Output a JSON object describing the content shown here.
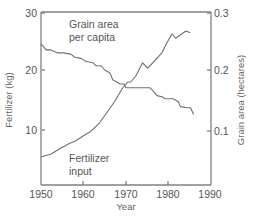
{
  "chart_data": {
    "type": "line",
    "title": "",
    "xlabel": "Year",
    "ylabel": "Fertilizer (kg)",
    "y2label": "Grain area (hectares)",
    "xlim": [
      1950,
      1990
    ],
    "ylim": [
      1,
      30
    ],
    "y2lim": [
      0.01,
      0.3
    ],
    "xticks": [
      "1950",
      "1960",
      "1970",
      "1980",
      "1990"
    ],
    "yticks": [
      "10",
      "20",
      "30"
    ],
    "y2ticks": [
      "0.1",
      "0.2",
      "0.3"
    ],
    "grid": false,
    "annotations": [
      {
        "text": "Grain area",
        "line2": "per capita"
      },
      {
        "text": "Fertilizer",
        "line2": "input"
      }
    ],
    "series": [
      {
        "name": "Grain area per capita",
        "axis": "right",
        "x": [
          1950.0,
          1950.5,
          1951.2,
          1952.3,
          1953.3,
          1954.0,
          1955.2,
          1957.0,
          1958.0,
          1959.4,
          1960.6,
          1962.2,
          1962.9,
          1964.1,
          1965.0,
          1966.2,
          1966.9,
          1968.6,
          1969.5,
          1970.0,
          1971.1,
          1975.6,
          1976.3,
          1977.3,
          1978.5,
          1979.2,
          1981.1,
          1982.3,
          1982.8,
          1984.5,
          1985.2,
          1985.9
        ],
        "values": [
          0.243,
          0.239,
          0.233,
          0.233,
          0.23,
          0.228,
          0.228,
          0.226,
          0.221,
          0.219,
          0.214,
          0.212,
          0.207,
          0.207,
          0.2,
          0.195,
          0.184,
          0.177,
          0.177,
          0.171,
          0.171,
          0.171,
          0.166,
          0.158,
          0.156,
          0.153,
          0.153,
          0.148,
          0.14,
          0.138,
          0.138,
          0.127
        ],
        "color": "#707070"
      },
      {
        "name": "Fertilizer input",
        "axis": "left",
        "x": [
          1950.0,
          1952.4,
          1954.7,
          1956.8,
          1958.2,
          1959.9,
          1961.6,
          1963.8,
          1965.6,
          1967.3,
          1969.2,
          1970.4,
          1971.1,
          1972.3,
          1973.9,
          1975.1,
          1976.7,
          1978.4,
          1979.6,
          1980.8,
          1981.7,
          1983.1,
          1984.1,
          1985.1
        ],
        "values": [
          5.5,
          6.0,
          7.0,
          7.8,
          8.2,
          9.0,
          9.7,
          11.2,
          13.0,
          14.7,
          17.0,
          18.0,
          18.0,
          19.0,
          21.2,
          20.3,
          21.5,
          22.8,
          24.5,
          26.0,
          25.3,
          26.0,
          26.5,
          26.2
        ],
        "color": "#707070"
      }
    ]
  },
  "plot": {
    "left": 41,
    "right": 211,
    "top": 12,
    "bottom": 185
  }
}
